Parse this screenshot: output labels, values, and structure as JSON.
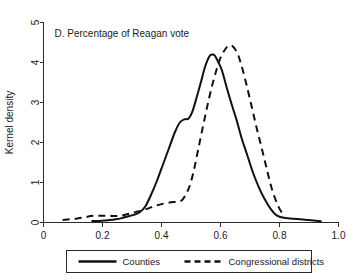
{
  "chart_data": {
    "type": "line",
    "title": "D. Percentage of Reagan vote",
    "xlabel": "",
    "ylabel": "Kernel density",
    "xlim": [
      0,
      1.0
    ],
    "ylim": [
      0,
      5
    ],
    "grid": false,
    "legend_position": "bottom",
    "xticks": [
      "0",
      "0.2",
      "0.4",
      "0.6",
      "0.8",
      "1.0"
    ],
    "xtick_values": [
      0,
      0.2,
      0.4,
      0.6,
      0.8,
      1.0
    ],
    "yticks": [
      "0",
      "1",
      "2",
      "3",
      "4",
      "5"
    ],
    "ytick_values": [
      0,
      1,
      2,
      3,
      4,
      5
    ],
    "series": [
      {
        "name": "Counties",
        "style": "solid",
        "color": "#111111",
        "x": [
          0.165,
          0.185,
          0.205,
          0.225,
          0.245,
          0.265,
          0.285,
          0.305,
          0.325,
          0.345,
          0.365,
          0.385,
          0.405,
          0.425,
          0.445,
          0.462,
          0.478,
          0.492,
          0.505,
          0.52,
          0.535,
          0.548,
          0.562,
          0.572,
          0.58,
          0.592,
          0.605,
          0.62,
          0.638,
          0.655,
          0.672,
          0.69,
          0.71,
          0.73,
          0.75,
          0.77,
          0.79,
          0.82,
          0.86,
          0.9,
          0.94
        ],
        "y": [
          0.04,
          0.04,
          0.05,
          0.06,
          0.08,
          0.11,
          0.15,
          0.19,
          0.25,
          0.4,
          0.7,
          1.05,
          1.45,
          1.85,
          2.25,
          2.5,
          2.58,
          2.6,
          2.78,
          3.15,
          3.55,
          3.9,
          4.15,
          4.2,
          4.18,
          4.02,
          3.8,
          3.4,
          2.95,
          2.55,
          2.1,
          1.7,
          1.25,
          0.88,
          0.58,
          0.34,
          0.18,
          0.11,
          0.09,
          0.06,
          0.03
        ]
      },
      {
        "name": "Congressional districts",
        "style": "dashed",
        "color": "#111111",
        "x": [
          0.065,
          0.09,
          0.115,
          0.14,
          0.16,
          0.18,
          0.2,
          0.222,
          0.245,
          0.268,
          0.29,
          0.312,
          0.335,
          0.358,
          0.38,
          0.4,
          0.42,
          0.44,
          0.458,
          0.472,
          0.488,
          0.5,
          0.512,
          0.525,
          0.54,
          0.555,
          0.57,
          0.585,
          0.6,
          0.615,
          0.628,
          0.642,
          0.658,
          0.672,
          0.688,
          0.705,
          0.722,
          0.74,
          0.758,
          0.775,
          0.795,
          0.815
        ],
        "y": [
          0.06,
          0.08,
          0.1,
          0.13,
          0.16,
          0.17,
          0.17,
          0.17,
          0.16,
          0.18,
          0.22,
          0.26,
          0.3,
          0.36,
          0.42,
          0.46,
          0.49,
          0.51,
          0.52,
          0.58,
          0.78,
          1.02,
          1.38,
          1.85,
          2.38,
          2.9,
          3.38,
          3.78,
          4.12,
          4.32,
          4.42,
          4.4,
          4.22,
          3.9,
          3.45,
          2.92,
          2.38,
          1.85,
          1.3,
          0.82,
          0.42,
          0.16
        ]
      }
    ]
  },
  "legend": {
    "items": [
      {
        "label": "Counties",
        "style": "solid"
      },
      {
        "label": "Congressional districts",
        "style": "dashed"
      }
    ]
  }
}
